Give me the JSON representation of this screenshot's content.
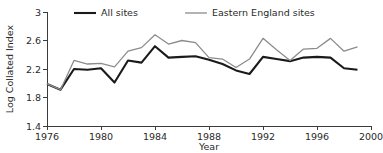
{
  "chart_data": {
    "type": "line",
    "title": "",
    "xlabel": "Year",
    "ylabel": "Log Collated Index",
    "xlim": [
      1976,
      2000
    ],
    "ylim": [
      1.4,
      3.0
    ],
    "xticks": [
      1976,
      1980,
      1984,
      1988,
      1992,
      1996,
      2000
    ],
    "xticklabels": [
      "1976",
      "1980",
      "1984",
      "1988",
      "1992",
      "1996",
      "2000"
    ],
    "yticks": [
      1.4,
      1.8,
      2.2,
      2.6,
      3.0
    ],
    "yticklabels": [
      "1.4",
      "1.8",
      "2.2",
      "2.6",
      "3"
    ],
    "grid": false,
    "legend_position": "top-center",
    "x": [
      1976,
      1977,
      1978,
      1979,
      1980,
      1981,
      1982,
      1983,
      1984,
      1985,
      1986,
      1987,
      1988,
      1989,
      1990,
      1991,
      1992,
      1993,
      1994,
      1995,
      1996,
      1997,
      1998,
      1999
    ],
    "series": [
      {
        "name": "All sites",
        "color": "#1a1a1a",
        "width": 2.1,
        "values": [
          1.99,
          1.91,
          2.2,
          2.19,
          2.21,
          2.01,
          2.32,
          2.29,
          2.52,
          2.36,
          2.37,
          2.38,
          2.33,
          2.27,
          2.18,
          2.13,
          2.37,
          2.34,
          2.31,
          2.36,
          2.37,
          2.36,
          2.21,
          2.19
        ]
      },
      {
        "name": "Eastern England sites",
        "color": "#8c8c8c",
        "width": 1.3,
        "values": [
          1.99,
          1.91,
          2.32,
          2.27,
          2.28,
          2.23,
          2.45,
          2.5,
          2.68,
          2.55,
          2.6,
          2.57,
          2.36,
          2.34,
          2.22,
          2.34,
          2.63,
          2.47,
          2.32,
          2.48,
          2.49,
          2.63,
          2.45,
          2.51
        ]
      }
    ]
  },
  "legend": {
    "items": [
      {
        "label": "All sites"
      },
      {
        "label": "Eastern England sites"
      }
    ]
  }
}
